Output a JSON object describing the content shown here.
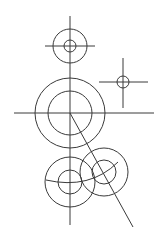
{
  "diagram": {
    "type": "technical-drawing",
    "stroke_color": "#3a3a3a",
    "background": "#ffffff",
    "main_axis": {
      "x1": 70,
      "y1": 16,
      "x2": 70,
      "y2": 225
    },
    "top_gear": {
      "cx": 70,
      "cy": 46,
      "outer_r": 17,
      "inner_r": 6,
      "hline": {
        "x1": 45,
        "y1": 46,
        "x2": 95,
        "y2": 46
      }
    },
    "small_right": {
      "cx": 123,
      "cy": 82,
      "r": 6,
      "vline": {
        "x1": 123,
        "y1": 58,
        "x2": 123,
        "y2": 108
      },
      "hline": {
        "x1": 99,
        "y1": 82,
        "x2": 148,
        "y2": 82
      }
    },
    "large_gear": {
      "cx": 70,
      "cy": 113,
      "outer_r": 35,
      "inner_r": 22,
      "hline": {
        "x1": 14,
        "y1": 113,
        "x2": 154,
        "y2": 113
      }
    },
    "diagonal": {
      "x1": 70,
      "y1": 113,
      "x2": 133,
      "y2": 227
    },
    "bottom_left_gear": {
      "cx": 70,
      "cy": 182,
      "outer_r": 25,
      "inner_r": 12
    },
    "bottom_right_gear": {
      "cx": 104,
      "cy": 172,
      "outer_r": 24,
      "inner_r": 12
    },
    "pitch_arc": "M 46 180 Q 90 190 118 162"
  }
}
